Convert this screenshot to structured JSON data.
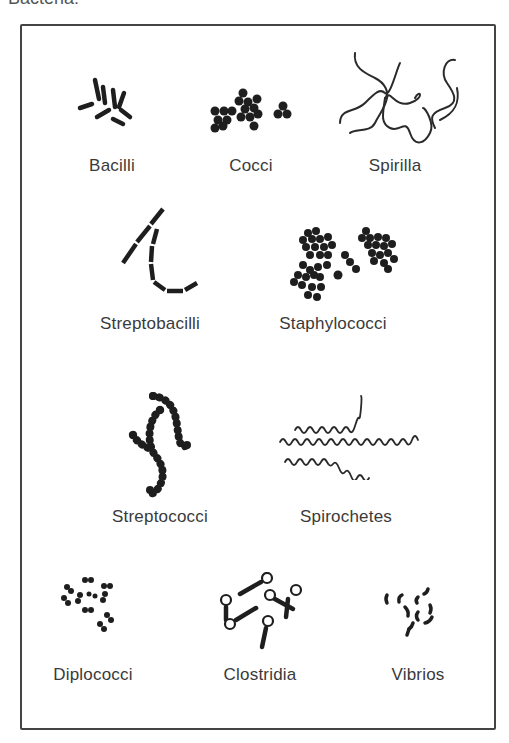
{
  "title": "Bacteria:",
  "organisms": [
    {
      "id": "bacilli",
      "label": "Bacilli"
    },
    {
      "id": "cocci",
      "label": "Cocci"
    },
    {
      "id": "spirilla",
      "label": "Spirilla"
    },
    {
      "id": "streptobacilli",
      "label": "Streptobacilli"
    },
    {
      "id": "staphylococci",
      "label": "Staphylococci"
    },
    {
      "id": "streptococci",
      "label": "Streptococci"
    },
    {
      "id": "spirochetes",
      "label": "Spirochetes"
    },
    {
      "id": "diplococci",
      "label": "Diplococci"
    },
    {
      "id": "clostridia",
      "label": "Clostridia"
    },
    {
      "id": "vibrios",
      "label": "Vibrios"
    }
  ],
  "colors": {
    "ink": "#1e1e1e",
    "text": "#3a3a3a",
    "frame": "#444444"
  }
}
